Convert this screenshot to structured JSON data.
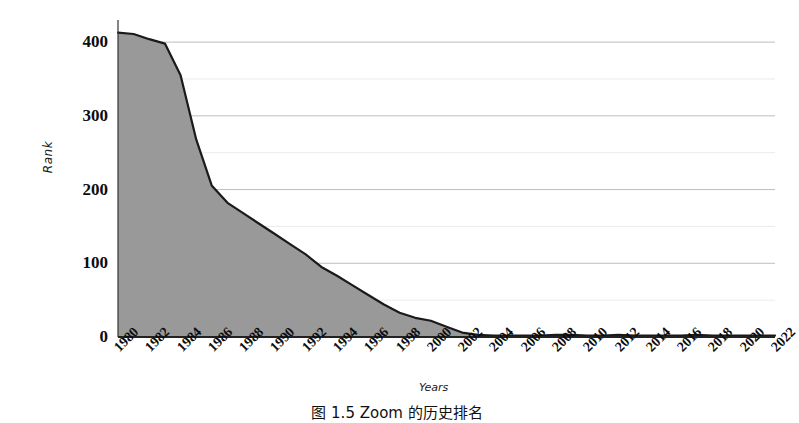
{
  "chart_data": {
    "type": "area",
    "title": "",
    "xlabel": "Years",
    "ylabel": "Rank",
    "xlim": [
      1980,
      2022
    ],
    "ylim": [
      0,
      430
    ],
    "grid": true,
    "legend_position": "none",
    "series_name": "Rank",
    "fill_color": "#999999",
    "line_color": "#1a1a1a",
    "grid_color": "#d9d9d9",
    "y_ticks": [
      0,
      100,
      200,
      300,
      400
    ],
    "y_minor_step": 50,
    "x_ticks": [
      "1980",
      "1982",
      "1984",
      "1986",
      "1988",
      "1990",
      "1992",
      "1994",
      "1996",
      "1998",
      "2000",
      "2002",
      "2004",
      "2006",
      "2008",
      "2010",
      "2012",
      "2014",
      "2016",
      "2018",
      "2020",
      "2022"
    ],
    "x": [
      1980,
      1981,
      1982,
      1983,
      1984,
      1985,
      1986,
      1987,
      1988,
      1989,
      1990,
      1991,
      1992,
      1993,
      1994,
      1995,
      1996,
      1997,
      1998,
      1999,
      2000,
      2001,
      2002,
      2003,
      2004,
      2005,
      2006,
      2007,
      2008,
      2009,
      2010,
      2011,
      2012,
      2013,
      2014,
      2015,
      2016,
      2017,
      2018,
      2019,
      2020,
      2021,
      2022
    ],
    "values": [
      413,
      411,
      404,
      398,
      355,
      268,
      205,
      182,
      168,
      154,
      140,
      126,
      112,
      95,
      83,
      70,
      57,
      44,
      33,
      26,
      22,
      14,
      6,
      3,
      2,
      2,
      2,
      2,
      3,
      3,
      2,
      2,
      3,
      2,
      2,
      2,
      2,
      3,
      2,
      2,
      2,
      2,
      2
    ]
  },
  "axis": {
    "y_label_text": "Rank",
    "x_label_text": "Years"
  },
  "caption": {
    "text": "图 1.5  Zoom 的历史排名"
  }
}
